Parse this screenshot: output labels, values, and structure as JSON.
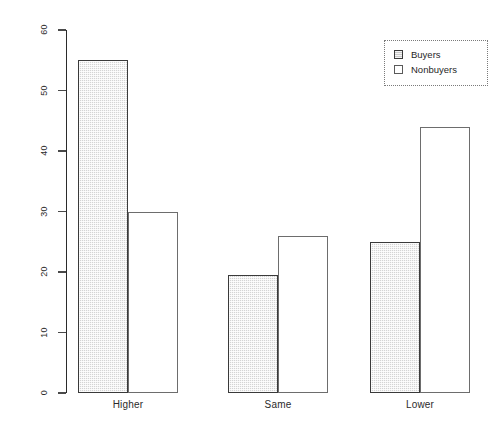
{
  "chart_data": {
    "type": "bar",
    "title": "",
    "subtitle": "",
    "xlabel": "",
    "ylabel": "",
    "categories": [
      "Higher",
      "Same",
      "Lower"
    ],
    "series": [
      {
        "name": "Buyers",
        "values": [
          55,
          19.5,
          25
        ]
      },
      {
        "name": "Nonbuyers",
        "values": [
          30,
          26,
          44
        ]
      }
    ],
    "ylim": [
      0,
      60
    ],
    "yticks": [
      0,
      10,
      20,
      30,
      40,
      50,
      60
    ],
    "ytick_labels": [
      "0",
      "10",
      "20",
      "30",
      "40",
      "50",
      "60"
    ],
    "grid": false,
    "legend_position": "top-right",
    "legend_entries": [
      "Buyers",
      "Nonbuyers"
    ],
    "bar_mode": "grouped",
    "colors": {
      "buyers_fill": "#d4d4d4",
      "buyers_border": "#3a3a3a",
      "nonbuyers_fill": "#ffffff",
      "nonbuyers_border": "#6d6d6d",
      "axis": "#2b2b2b",
      "text": "#1a1a1a",
      "background": "#ffffff"
    }
  },
  "legend": {
    "items": [
      {
        "label": "Buyers",
        "key": "filled-square-icon"
      },
      {
        "label": "Nonbuyers",
        "key": "empty-square-icon"
      }
    ]
  },
  "axes": {
    "y": {
      "ticks": [
        {
          "label": "0",
          "value": 0
        },
        {
          "label": "10",
          "value": 10
        },
        {
          "label": "20",
          "value": 20
        },
        {
          "label": "30",
          "value": 30
        },
        {
          "label": "40",
          "value": 40
        },
        {
          "label": "50",
          "value": 50
        },
        {
          "label": "60",
          "value": 60
        }
      ]
    },
    "x": {
      "ticks": [
        {
          "label": "Higher"
        },
        {
          "label": "Same"
        },
        {
          "label": "Lower"
        }
      ]
    }
  }
}
